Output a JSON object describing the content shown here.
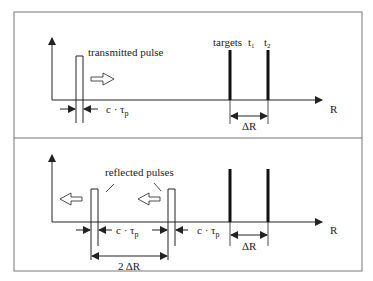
{
  "diagram": {
    "type": "radar-range-resolution",
    "panels": [
      {
        "id": "top",
        "pulse_label": "transmitted pulse",
        "targets_label": "targets",
        "target1_label": "t",
        "target1_sub": "1",
        "target2_label": "t",
        "target2_sub": "2",
        "pulse_width_label": "c · τ",
        "pulse_width_sub": "p",
        "target_spacing_label": "ΔR",
        "axis_label": "R"
      },
      {
        "id": "bottom",
        "pulses_label": "reflected pulses",
        "pulse_width_label_1": "c · τ",
        "pulse_width_sub_1": "p",
        "pulse_width_label_2": "c · τ",
        "pulse_width_sub_2": "p",
        "pulse_spacing_label": "2 ΔR",
        "target_spacing_label": "ΔR",
        "axis_label": "R"
      }
    ],
    "colors": {
      "line": "#222222",
      "frame": "#777777"
    }
  }
}
